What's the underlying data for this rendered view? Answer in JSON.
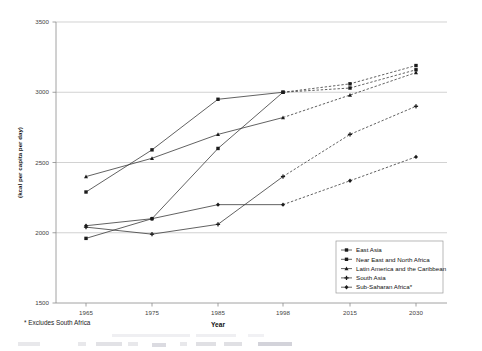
{
  "chart_data": {
    "type": "line",
    "title": "",
    "xlabel": "Year",
    "ylabel": "(kcal per capita per day)",
    "categories": [
      "1965",
      "1975",
      "1985",
      "1998",
      "2015",
      "2030"
    ],
    "x": [
      1965,
      1975,
      1985,
      1998,
      2015,
      2030
    ],
    "ylim": [
      1500,
      3500
    ],
    "ytick_labels": [
      "1500",
      "2000",
      "2500",
      "3000",
      "3500"
    ],
    "ytick_values": [
      1500,
      2000,
      2500,
      3000,
      3500
    ],
    "grid": true,
    "legend_position": "bottom-right",
    "footnote": "* Excludes South Africa",
    "series": [
      {
        "name": "East Asia",
        "values": [
          1960,
          2100,
          2600,
          3000,
          3060,
          3190
        ],
        "projected_from": 1998,
        "marker": "square"
      },
      {
        "name": "Near East and North Africa",
        "values": [
          2290,
          2590,
          2950,
          3000,
          3030,
          3160
        ],
        "projected_from": 1998,
        "marker": "square"
      },
      {
        "name": "Latin America and the Caribbean",
        "values": [
          2400,
          2530,
          2700,
          2820,
          2980,
          3140
        ],
        "projected_from": 1998,
        "marker": "triangle"
      },
      {
        "name": "South Asia",
        "values": [
          2040,
          1990,
          2060,
          2400,
          2700,
          2900
        ],
        "projected_from": 1998,
        "marker": "cross"
      },
      {
        "name": "Sub-Saharan Africa*",
        "values": [
          2050,
          2100,
          2200,
          2200,
          2370,
          2540
        ],
        "projected_from": 1998,
        "marker": "diamond"
      }
    ]
  },
  "legend": {
    "items": [
      {
        "label": "East Asia"
      },
      {
        "label": "Near East and North Africa"
      },
      {
        "label": "Latin America and the Caribbean"
      },
      {
        "label": "South Asia"
      },
      {
        "label": "Sub-Saharan Africa*"
      }
    ]
  },
  "axes": {
    "x_title": "Year",
    "y_title": "(kcal per capita per day)",
    "x_ticks": [
      "1965",
      "1975",
      "1985",
      "1998",
      "2015",
      "2030"
    ],
    "y_ticks": [
      "3500",
      "3000",
      "2500",
      "2000",
      "1500"
    ]
  },
  "notes": {
    "footnote": "* Excludes South Africa"
  }
}
